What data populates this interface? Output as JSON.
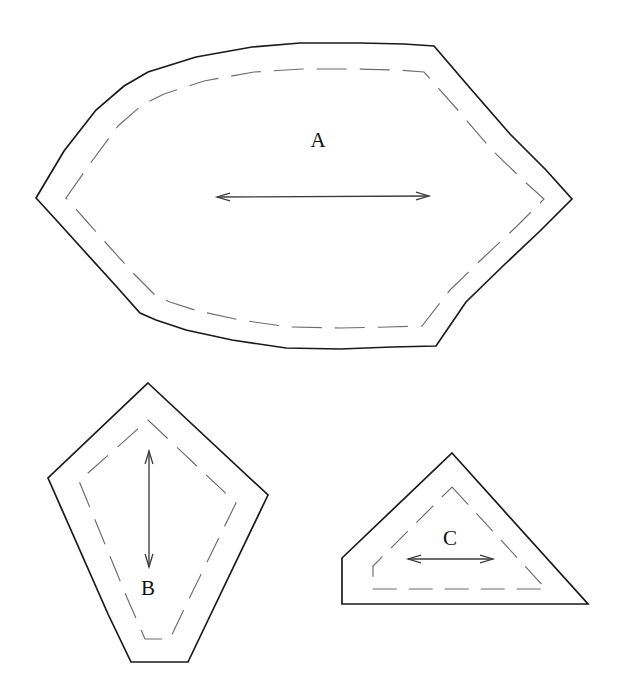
{
  "figure": {
    "background_color": "#ffffff",
    "width": 621,
    "height": 690,
    "stroke_colors": {
      "outer_outline": "#1a1a1a",
      "inner_outline": "#6d6d6d",
      "dimension_arrow": "#3b3b3b",
      "label_text": "#111111"
    }
  },
  "shapes": [
    {
      "id": "A",
      "label": "A",
      "label_position": {
        "x": 318,
        "y": 147
      },
      "description": "large hexagonal rounded outline with dashed inner offset",
      "arrow": {
        "orientation": "horizontal",
        "double_headed": true,
        "x1": 217,
        "y1": 197,
        "x2": 429,
        "y2": 196
      },
      "outer_points": "36,198 64,151 96,110 124,86 148,72 196,57 252,47 300,43 360,43 404,44 434,46 470,88 510,134 546,170 572,199 540,231 504,265 466,302 436,346 392,347 340,349 286,348 232,340 186,330 156,320 140,313 116,286 86,253 58,222",
      "inner_points": "66,198 92,161 118,126 142,105 164,94 204,81 254,72 302,69 354,69 398,70 424,72 456,108 492,150 524,181 544,199 516,227 484,257 450,290 422,326 388,327 340,328 290,327 240,320 198,311 170,302 156,296 132,272 106,243 82,216"
    },
    {
      "id": "B",
      "label": "B",
      "label_position": {
        "x": 148,
        "y": 595
      },
      "description": "kite-shaped pentagon with dashed inner offset",
      "arrow": {
        "orientation": "vertical",
        "double_headed": true,
        "x1": 149,
        "y1": 451,
        "x2": 149,
        "y2": 567
      },
      "outer_points": "148,383 268,495 209,618 188,662 131,662 108,614 48,478",
      "inner_points": "148,420 236,503 185,607 170,639 145,639 128,600 79,481"
    },
    {
      "id": "C",
      "label": "C",
      "label_position": {
        "x": 450,
        "y": 545
      },
      "description": "triangle with clipped lower-left corner and dashed inner offset",
      "arrow": {
        "orientation": "horizontal",
        "double_headed": true,
        "x1": 408,
        "y1": 559,
        "x2": 493,
        "y2": 559
      },
      "outer_points": "452,453 588,604 342,604 342,558",
      "inner_points": "452,487 546,589 373,589 373,566"
    }
  ]
}
